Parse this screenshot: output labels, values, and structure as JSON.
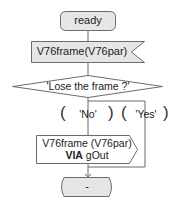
{
  "diagram": {
    "type": "SDL state transition flowchart",
    "colors": {
      "stroke": "#6b6b6b",
      "fill_gray": "#e6e6e6",
      "fill_white": "#ffffff",
      "text": "#222222"
    },
    "start_state": {
      "label": "ready"
    },
    "input_signal": {
      "label": "V76frame(V76par)"
    },
    "decision": {
      "label": "'Lose the frame ?'"
    },
    "answers": [
      {
        "label": "'No'"
      },
      {
        "label": "'Yes'"
      }
    ],
    "parens": {
      "open": "(",
      "close": ")"
    },
    "output_signal": {
      "line1": "V76frame (V76par)",
      "via_keyword": "VIA",
      "via_target": "gOut"
    },
    "next_state": {
      "label": "-"
    }
  }
}
